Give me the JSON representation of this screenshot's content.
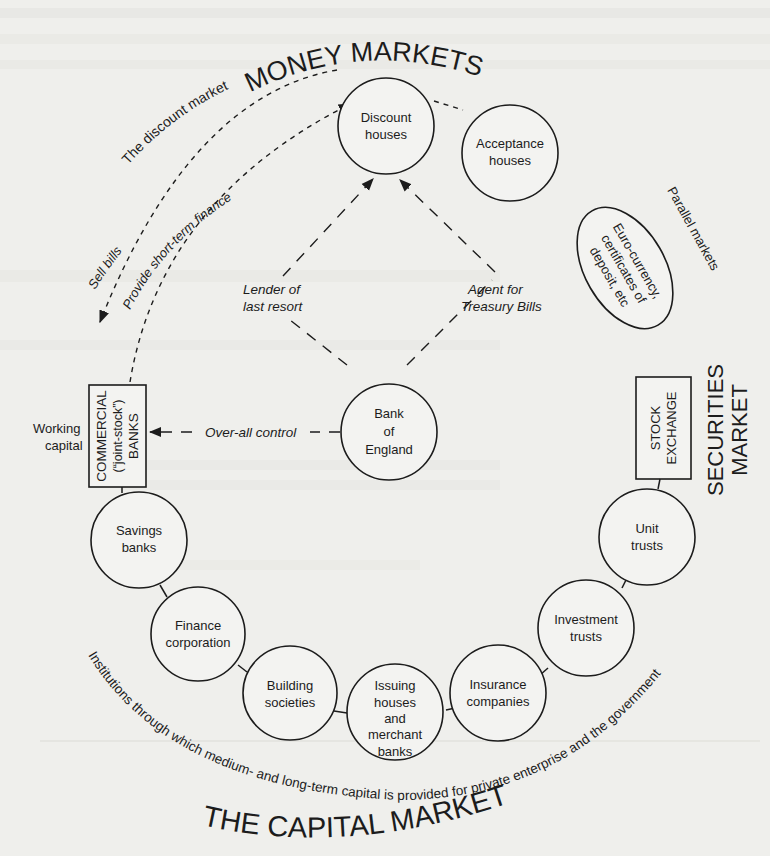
{
  "titles": {
    "money_markets": "MONEY MARKETS",
    "capital_market": "THE CAPITAL MARKET",
    "securities_market_line1": "SECURITIES",
    "securities_market_line2": "MARKET"
  },
  "money_market_nodes": {
    "discount_houses": [
      "Discount",
      "houses"
    ],
    "acceptance_houses": [
      "Acceptance",
      "houses"
    ],
    "bank_of_england": [
      "Bank",
      "of",
      "England"
    ],
    "parallel_markets_ellipse": [
      "Euro-currency,",
      "certificates of",
      "deposit, etc"
    ]
  },
  "boxes": {
    "commercial_banks": [
      "COMMERCIAL",
      "(“joint-stock”)",
      "BANKS"
    ],
    "stock_exchange": [
      "STOCK",
      "EXCHANGE"
    ]
  },
  "capital_market_nodes": {
    "savings_banks": [
      "Savings",
      "banks"
    ],
    "finance_corporation": [
      "Finance",
      "corporation"
    ],
    "building_societies": [
      "Building",
      "societies"
    ],
    "issuing_houses": [
      "Issuing",
      "houses",
      "and",
      "merchant",
      "banks"
    ],
    "insurance_companies": [
      "Insurance",
      "companies"
    ],
    "investment_trusts": [
      "Investment",
      "trusts"
    ],
    "unit_trusts": [
      "Unit",
      "trusts"
    ]
  },
  "flow_labels": {
    "discount_market": "The discount market",
    "sell_bills": "Sell bills",
    "provide_finance": "Provide short-term finance",
    "lender_of_last_resort": [
      "Lender of",
      "last resort"
    ],
    "agent_for_treasury_bills": [
      "Agent for",
      "Treasury Bills"
    ],
    "over_all_control": "Over-all control",
    "parallel_markets": "Parallel markets",
    "working_capital": [
      "Working",
      "capital"
    ]
  },
  "capital_market_caption": "Institutions through which medium- and long-term capital is provided for private enterprise and the government",
  "colors": {
    "ink": "#1c1c1c",
    "paper": "#efefec"
  }
}
